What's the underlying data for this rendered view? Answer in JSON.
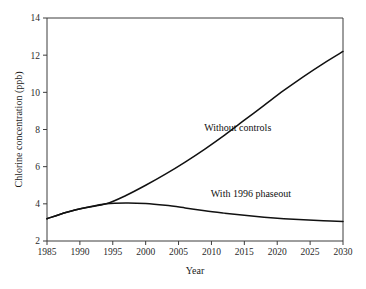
{
  "chart_data": {
    "type": "line",
    "title": "",
    "xlabel": "Year",
    "ylabel": "Chlorine concentration (ppb)",
    "xlim": [
      1985,
      2030
    ],
    "ylim": [
      2,
      14
    ],
    "xticks": [
      1985,
      1990,
      1995,
      2000,
      2005,
      2010,
      2015,
      2020,
      2025,
      2030
    ],
    "yticks": [
      2,
      4,
      6,
      8,
      10,
      12,
      14
    ],
    "grid": false,
    "legend": "inline-annotations",
    "series": [
      {
        "name": "Without controls",
        "annotation": "Without controls",
        "annotation_x": 2014,
        "annotation_y": 7.9,
        "x": [
          1985,
          1988,
          1991,
          1994,
          1997,
          2000,
          2003,
          2006,
          2009,
          2012,
          2015,
          2018,
          2021,
          2024,
          2027,
          2030
        ],
        "values": [
          3.2,
          3.55,
          3.8,
          4.0,
          4.45,
          5.0,
          5.6,
          6.25,
          6.95,
          7.7,
          8.5,
          9.3,
          10.1,
          10.85,
          11.55,
          12.2
        ]
      },
      {
        "name": "With 1996 phaseout",
        "annotation": "With 1996 phaseout",
        "annotation_x": 2016,
        "annotation_y": 4.35,
        "x": [
          1985,
          1988,
          1991,
          1994,
          1997,
          2000,
          2003,
          2006,
          2009,
          2012,
          2015,
          2018,
          2021,
          2024,
          2027,
          2030
        ],
        "values": [
          3.2,
          3.55,
          3.8,
          4.0,
          4.05,
          4.02,
          3.92,
          3.78,
          3.63,
          3.5,
          3.38,
          3.28,
          3.2,
          3.14,
          3.09,
          3.05
        ]
      }
    ],
    "branch_point": {
      "x": 1994.5,
      "y": 4.0
    },
    "colors": {
      "line": "#111111",
      "axis": "#3c3c3c",
      "background": "#ffffff"
    }
  }
}
